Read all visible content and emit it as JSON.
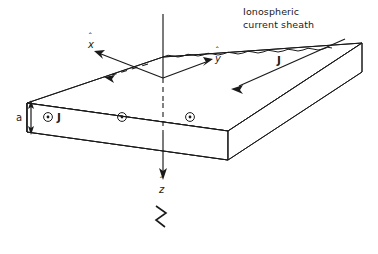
{
  "figure": {
    "background_color": "#ffffff",
    "ink_color": "#1a1a1a",
    "width": 378,
    "height": 254
  },
  "labels": {
    "sheath_line1": "Ionospheric",
    "sheath_line2": "current sheath",
    "axis_x": "x",
    "axis_y": "y",
    "axis_z": "z",
    "hat_symbol": "ˆ",
    "current_top": "J",
    "current_front": "J",
    "thickness": "a",
    "break_mark": "≈"
  },
  "symbols": {
    "current_out_of_page": "⊙",
    "out_of_page_count": 3,
    "out_of_page_positions": [
      {
        "cx": 48,
        "cy": 117
      },
      {
        "cx": 122,
        "cy": 117
      },
      {
        "cx": 190,
        "cy": 117
      }
    ]
  },
  "geometry": {
    "slab_front_face": {
      "x_left": 27,
      "x_right": 228,
      "y_top": 103,
      "y_bottom": 132
    },
    "slab_top_back_left": {
      "x": 163,
      "y": 57
    },
    "slab_top_back_right": {
      "x": 362,
      "y": 43
    },
    "slab_right_bottom": {
      "x": 362,
      "y": 72
    },
    "origin": {
      "x": 163,
      "y": 78
    },
    "z_axis_top": {
      "x": 163,
      "y": 14
    },
    "z_axis_bottom": {
      "x": 163,
      "y": 178
    }
  },
  "annotations": {
    "axis_x_description": "unit vector x-hat pointing up-left from origin",
    "axis_y_description": "unit vector y-hat pointing up-right from origin",
    "axis_z_description": "unit vector z-hat pointing down through the slab",
    "top_current_description": "current J flowing along the top surface toward lower-left",
    "front_current_description": "current J out of the page within the slab cross-section",
    "thickness_description": "slab thickness a marked by double-headed arrow on the left edge",
    "wavy_description": "wavy line along the back top edge denoting the ionospheric current sheath"
  }
}
